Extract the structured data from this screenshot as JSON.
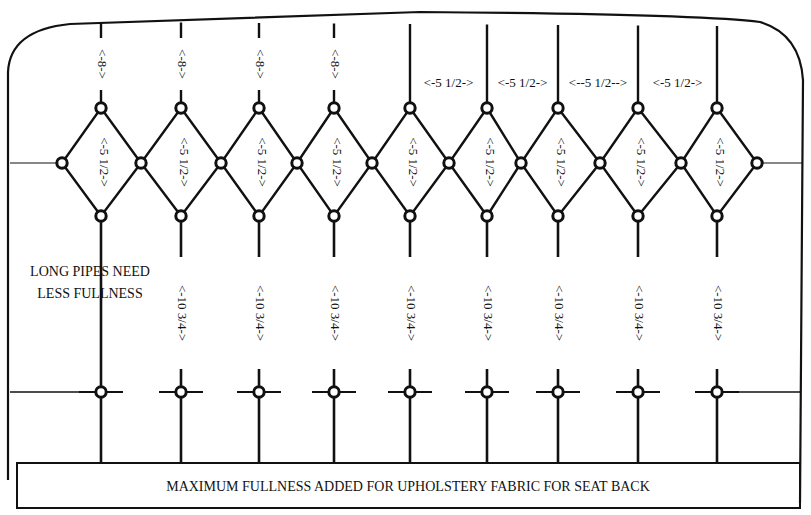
{
  "diagram": {
    "footer_label": "MAXIMUM FULLNESS ADDED FOR UPHOLSTERY FABRIC FOR SEAT BACK",
    "side_note": [
      "LONG PIPES NEED",
      "LESS FULLNESS"
    ],
    "colors": {
      "ink": "#111111",
      "paper": "#ffffff"
    },
    "columns_x": [
      101,
      181,
      259,
      334,
      410,
      487,
      558,
      638,
      717
    ],
    "mid_points_x": [
      62,
      141,
      221,
      297,
      372,
      449,
      521,
      600,
      681,
      757
    ],
    "rows_y": {
      "top_button": 108,
      "mid_button": 163,
      "bottom_button": 216,
      "lower_button": 392,
      "frame_top": 36,
      "footer_top": 463,
      "footer_bottom": 508
    },
    "top_dimensions": [
      {
        "column": 0,
        "text": "<-8->"
      },
      {
        "column": 1,
        "text": "<-8->"
      },
      {
        "column": 2,
        "text": "<-8->"
      },
      {
        "column": 3,
        "text": "<-8->"
      }
    ],
    "horizontal_dimensions": [
      {
        "from": 4,
        "to": 5,
        "text": "<-5 1/2->"
      },
      {
        "from": 5,
        "to": 6,
        "text": "<-5 1/2->"
      },
      {
        "from": 6,
        "to": 7,
        "text": "<--5 1/2-->"
      },
      {
        "from": 7,
        "to": 8,
        "text": "<-5 1/2->"
      }
    ],
    "diamond_dimensions": [
      "<-5 1/2->",
      "<-5 1/2->",
      "<-5 1/2->",
      "<-5 1/2->",
      "<-5 1/2->",
      "<-5 1/2->",
      "<-5 1/2->",
      "<-5 1/2->",
      "<-5 1/2->"
    ],
    "pipe_dimensions": [
      null,
      "<-10 3/4->",
      "<-10 3/4->",
      "<-10 3/4->",
      "<-10 3/4->",
      "<-10 3/4->",
      "<-10 3/4->",
      "<-10 3/4->",
      "<-10 3/4->"
    ]
  }
}
